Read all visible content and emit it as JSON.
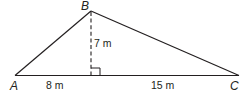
{
  "diagram": {
    "type": "triangle",
    "vertices": {
      "A": "A",
      "B": "B",
      "C": "C"
    },
    "measurements": {
      "height": "7 m",
      "left_base_segment": "8 m",
      "right_base_segment": "15 m"
    },
    "altitude_style": "dashed",
    "right_angle_marker": true,
    "colors": {
      "stroke": "#231f20",
      "background": "#ffffff"
    }
  }
}
